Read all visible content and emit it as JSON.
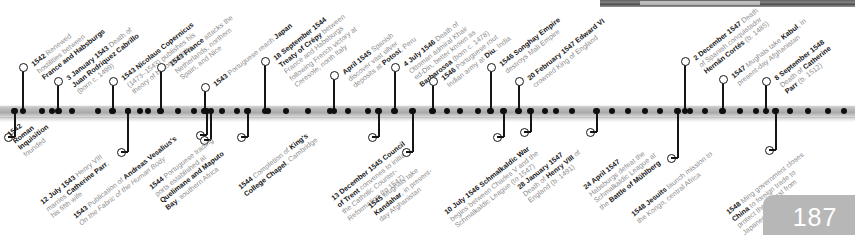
{
  "document": {
    "page_number": "187",
    "axis_label": "timeline-axis"
  },
  "events_above": [
    {
      "lines": [
        "<b>1542</b> Renewed",
        "hostilities between",
        "<b>France and Habsburgs</b>"
      ],
      "x": 22,
      "stem_top": 68,
      "label_x": 30,
      "label_y": 62
    },
    {
      "lines": [
        "<b>3 January 1543</b> Death of",
        "<b>Juan Rodriquez Cabrillo</b>",
        "(born c. 1499)"
      ],
      "x": 57,
      "stem_top": 82,
      "label_x": 65,
      "label_y": 76
    },
    {
      "lines": [
        "<b>1543 Nicolaus Copernicus</b>",
        "(1473&ndash;1543) publishes his",
        "theory of heliocentricity"
      ],
      "x": 112,
      "stem_top": 82,
      "label_x": 120,
      "label_y": 76
    },
    {
      "lines": [
        "<b>1543 France</b> attacks the",
        "Netherlands, northern",
        "Spain, and Nice"
      ],
      "x": 160,
      "stem_top": 68,
      "label_x": 168,
      "label_y": 62
    },
    {
      "lines": [
        "<b>1543</b> Portuguese reach <b>Japan</b>"
      ],
      "x": 204,
      "stem_top": 88,
      "label_x": 212,
      "label_y": 82
    },
    {
      "lines": [
        "<b>18 September 1544</b>",
        "<b>Treaty of Crépy</b> between",
        "France and Habsburgs",
        "following French victory at",
        "Ceresole, north Italy"
      ],
      "x": 264,
      "stem_top": 62,
      "label_x": 272,
      "label_y": 56
    },
    {
      "lines": [
        "<b>April 1545</b> Spanish",
        "discover vast silver",
        "deposits at <b>Potosí</b>, Peru"
      ],
      "x": 333,
      "stem_top": 76,
      "label_x": 341,
      "label_y": 70
    },
    {
      "lines": [
        "<b>4 July 1546</b> Death of",
        "Ottoman admiral Khair",
        "ed-Din, better known as",
        "<b>Barbarossa</b> (born c. 1478)"
      ],
      "x": 394,
      "stem_top": 68,
      "label_x": 402,
      "label_y": 62
    },
    {
      "lines": [
        "<b>1546</b> Portuguese rout",
        "Indian army at <b>Diu</b>, India"
      ],
      "x": 432,
      "stem_top": 82,
      "label_x": 440,
      "label_y": 76
    },
    {
      "lines": [
        "<b>1546 Songhay Empire</b>",
        "destroys Mali Empire"
      ],
      "x": 490,
      "stem_top": 68,
      "label_x": 498,
      "label_y": 62
    },
    {
      "lines": [
        "<b>20 February 1547 Edward VI</b>",
        "crowned King of England"
      ],
      "x": 518,
      "stem_top": 82,
      "label_x": 526,
      "label_y": 76
    },
    {
      "lines": [
        "<b>2 December 1547</b> Death",
        "of Spanish conquistador",
        "<b>Hernán Cortés</b> (b. 1485)"
      ],
      "x": 684,
      "stem_top": 62,
      "label_x": 692,
      "label_y": 56
    },
    {
      "lines": [
        "<b>1547</b> Mughals take <b>Kabul</b>, in",
        "present-day Afghanistan"
      ],
      "x": 722,
      "stem_top": 80,
      "label_x": 730,
      "label_y": 74
    },
    {
      "lines": [
        "<b>8 September 1548</b>",
        "Death of <b>Catherine</b>",
        "<b>Parr</b> (b. 1512)"
      ],
      "x": 765,
      "stem_top": 82,
      "label_x": 773,
      "label_y": 76
    }
  ],
  "events_below": [
    {
      "lines": [
        "<b>1542</b>",
        "<b>Roman</b>",
        "<b>Inquisition</b>",
        "founded"
      ],
      "x": 14,
      "stem_bot": 137,
      "label_x": 6,
      "label_y": 132
    },
    {
      "lines": [
        "<b>12 July 1543</b> Henry VIII",
        "marries <b>Catherine Parr</b>,",
        "his fifth wife"
      ],
      "x": 127,
      "stem_bot": 152,
      "label_x": 39,
      "label_y": 200
    },
    {
      "lines": [
        "<b>1543</b> Publication of <b>Andreas Vesalius's</b>",
        "<i>On the Fabric of the Human Body</i>"
      ],
      "x": 206,
      "stem_bot": 135,
      "label_x": 72,
      "label_y": 214
    },
    {
      "lines": [
        "<b>1544</b> Portuguese trading",
        "ports established at",
        "<b>Quelimane and Maputo</b>",
        "<b>Bay</b>, southern Africa"
      ],
      "x": 210,
      "stem_bot": 140,
      "label_x": 148,
      "label_y": 185
    },
    {
      "lines": [
        "<b>1544</b> Completion of <b>King's</b>",
        "<b>College Chapel</b>, Cambridge"
      ],
      "x": 247,
      "stem_bot": 137,
      "label_x": 237,
      "label_y": 185
    },
    {
      "lines": [
        "<b>13 December 1545 Council</b>",
        "<b>of Trent</b> convenes to initiate",
        "the Catholic Counter-",
        "Reformation (to 1547)"
      ],
      "x": 378,
      "stem_bot": 137,
      "label_x": 330,
      "label_y": 196
    },
    {
      "lines": [
        "<b>1545</b> Mughals take",
        "<b>Kandahar</b>, in present-",
        "day Afghanistan"
      ],
      "x": 412,
      "stem_bot": 152,
      "label_x": 367,
      "label_y": 204
    },
    {
      "lines": [
        "<b>10 July 1546 Schmalkaldic War</b>",
        "begins between Charles V and the",
        "Schmalkaldic League (to 1547)"
      ],
      "x": 503,
      "stem_bot": 137,
      "label_x": 443,
      "label_y": 210
    },
    {
      "lines": [
        "<b>28 January 1547</b>",
        "Death of <b>Henry VIII</b> of",
        "England (b. 1491)"
      ],
      "x": 530,
      "stem_bot": 132,
      "label_x": 516,
      "label_y": 185
    },
    {
      "lines": [
        "<b>24 April 1547</b>",
        "Habsburgs defeat the",
        "Schmalkaldic League at",
        "the <b>Battle of Mühlberg</b>"
      ],
      "x": 596,
      "stem_bot": 132,
      "label_x": 582,
      "label_y": 185
    },
    {
      "lines": [
        "<b>1548 Jesuits</b> launch mission to",
        "the Kongo, central Africa"
      ],
      "x": 677,
      "stem_bot": 158,
      "label_x": 630,
      "label_y": 212
    },
    {
      "lines": [
        "<b>1548</b> Ming government closes",
        "<b>China</b> to foreign trade to",
        "protect their coast from",
        "Japanese pirates"
      ],
      "x": 775,
      "stem_bot": 150,
      "label_x": 725,
      "label_y": 210
    }
  ],
  "axis_ticks": [
    14,
    42,
    52,
    59,
    72,
    98,
    112,
    128,
    140,
    148,
    160,
    178,
    194,
    204,
    222,
    237,
    247,
    268,
    286,
    308,
    330,
    348,
    368,
    378,
    394,
    412,
    432,
    447,
    460,
    478,
    490,
    503,
    518,
    530,
    545,
    556,
    572,
    596,
    612,
    628,
    645,
    660,
    677,
    690,
    705,
    722,
    740,
    756,
    775,
    790,
    808,
    828,
    844
  ]
}
